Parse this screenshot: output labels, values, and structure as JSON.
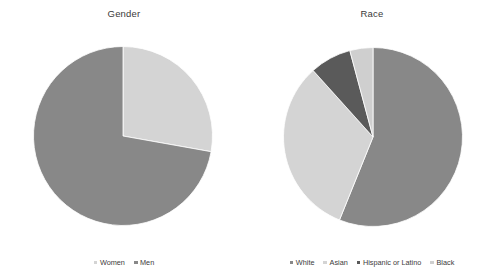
{
  "chart_data": [
    {
      "type": "pie",
      "title": "Gender",
      "xlabel": "",
      "ylabel": "",
      "legend_position": "bottom",
      "grid": false,
      "start_angle_deg": 0,
      "direction": "clockwise",
      "categories": [
        "Women",
        "Men"
      ],
      "values": [
        27.8,
        72.2
      ],
      "value_unit": "percent",
      "slices": [
        {
          "label": "Women",
          "value": 27.8,
          "color": "#d4d4d4",
          "start_deg": 0,
          "end_deg": 100.1
        },
        {
          "label": "Men",
          "value": 72.2,
          "color": "#888888",
          "start_deg": 100.1,
          "end_deg": 360
        }
      ],
      "legend": [
        {
          "label": "Women",
          "color": "#d4d4d4"
        },
        {
          "label": "Men",
          "color": "#888888"
        }
      ]
    },
    {
      "type": "pie",
      "title": "Race",
      "xlabel": "",
      "ylabel": "",
      "legend_position": "bottom",
      "grid": false,
      "start_angle_deg": 0,
      "direction": "clockwise",
      "categories": [
        "White",
        "Asian",
        "Hispanic or Latino",
        "Black"
      ],
      "values": [
        56.1,
        32.2,
        7.5,
        4.2
      ],
      "value_unit": "percent",
      "slices": [
        {
          "label": "White",
          "value": 56.1,
          "color": "#888888",
          "start_deg": 0,
          "end_deg": 202
        },
        {
          "label": "Asian",
          "value": 32.2,
          "color": "#d4d4d4",
          "start_deg": 202,
          "end_deg": 318
        },
        {
          "label": "Hispanic or Latino",
          "value": 7.5,
          "color": "#5a5a5a",
          "start_deg": 318,
          "end_deg": 345
        },
        {
          "label": "Black",
          "value": 4.2,
          "color": "#cfcfcf",
          "start_deg": 345,
          "end_deg": 360
        }
      ],
      "legend": [
        {
          "label": "White",
          "color": "#888888"
        },
        {
          "label": "Asian",
          "color": "#d4d4d4"
        },
        {
          "label": "Hispanic or Latino",
          "color": "#5a5a5a"
        },
        {
          "label": "Black",
          "color": "#cfcfcf"
        }
      ]
    }
  ],
  "layout": {
    "gender_pie": {
      "cx": 123,
      "cy": 136,
      "r": 90
    },
    "race_pie": {
      "cx": 125,
      "cy": 137,
      "r": 90
    }
  }
}
